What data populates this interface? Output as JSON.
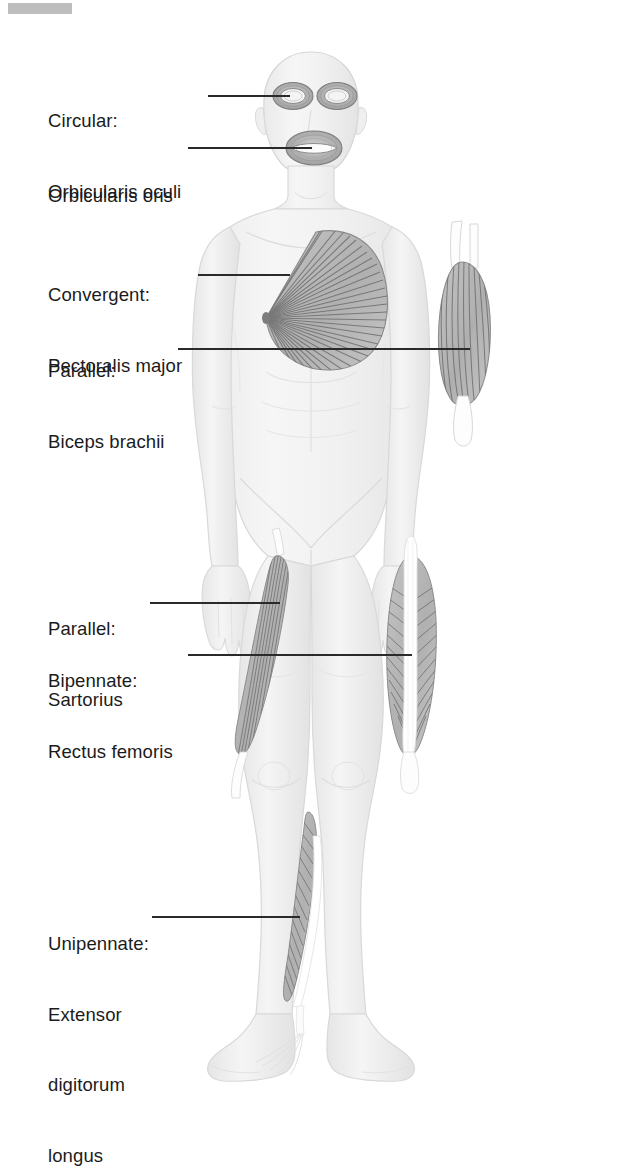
{
  "document": {
    "type": "anatomical-illustration",
    "subject": "Human muscle fascicle arrangement patterns",
    "view": "anterior full-body"
  },
  "artifacts": {
    "redaction_bar": {
      "name": "redaction-bar",
      "color": "#b4b4b4"
    }
  },
  "colors": {
    "background": "#ffffff",
    "text": "#1b1b1b",
    "leader_line": "#2a2a2a",
    "body_fill": "#f2f2f2",
    "body_outline": "#d8d8d8",
    "muscle_fill": "#b9b9b9",
    "muscle_fiber": "#6e6e6e",
    "tendon": "#ffffff"
  },
  "labels": [
    {
      "id": "orbicularis-oculi",
      "type": "Circular:",
      "name": "Orbicularis oculi",
      "muscle": "orbicularis-oculi",
      "arrangement": "circular"
    },
    {
      "id": "orbicularis-oris",
      "type": "",
      "name": "Orbicularis oris",
      "muscle": "orbicularis-oris",
      "arrangement": "circular"
    },
    {
      "id": "pectoralis-major",
      "type": "Convergent:",
      "name": "Pectoralis major",
      "muscle": "pectoralis-major",
      "arrangement": "convergent"
    },
    {
      "id": "biceps-brachii",
      "type": "Parallel:",
      "name": "Biceps brachii",
      "muscle": "biceps-brachii",
      "arrangement": "parallel"
    },
    {
      "id": "sartorius",
      "type": "Parallel:",
      "name": "Sartorius",
      "muscle": "sartorius",
      "arrangement": "parallel"
    },
    {
      "id": "rectus-femoris",
      "type": "Bipennate:",
      "name": "Rectus femoris",
      "muscle": "rectus-femoris",
      "arrangement": "bipennate"
    },
    {
      "id": "extensor-digitorum-longus",
      "type": "Unipennate:",
      "name_line1": "Extensor",
      "name_line2": "digitorum",
      "name_line3": "longus",
      "muscle": "extensor-digitorum-longus",
      "arrangement": "unipennate"
    }
  ]
}
